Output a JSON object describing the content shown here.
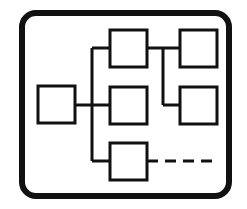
{
  "canvas": {
    "width": 247,
    "height": 209,
    "background_color": "#ffffff",
    "title": "Block Diagram Icon"
  },
  "icon": {
    "name": "network-block-diagram-icon",
    "stroke_color": "#111111",
    "fill_color": "#ffffff",
    "description": "Rounded rectangular frame containing six connected square nodes and a dashed link"
  },
  "frame": {
    "name": "rounded-frame",
    "x": 22,
    "y": 13,
    "width": 207,
    "height": 183,
    "corner_radius": 14,
    "stroke_width": 6,
    "stroke_color": "#111111",
    "fill_color": "#ffffff"
  },
  "nodes": [
    {
      "id": "node-left",
      "label": "left-node",
      "x": 38,
      "y": 86,
      "width": 37,
      "height": 37,
      "stroke_width": 3,
      "stroke_color": "#111111",
      "fill_color": "#ffffff"
    },
    {
      "id": "node-top-middle",
      "label": "top-middle-node",
      "x": 110,
      "y": 30,
      "width": 37,
      "height": 37,
      "stroke_width": 3,
      "stroke_color": "#111111",
      "fill_color": "#ffffff"
    },
    {
      "id": "node-center-middle",
      "label": "center-middle-node",
      "x": 110,
      "y": 87,
      "width": 37,
      "height": 37,
      "stroke_width": 3,
      "stroke_color": "#111111",
      "fill_color": "#ffffff"
    },
    {
      "id": "node-bottom-middle",
      "label": "bottom-middle-node",
      "x": 110,
      "y": 143,
      "width": 37,
      "height": 37,
      "stroke_width": 3,
      "stroke_color": "#111111",
      "fill_color": "#ffffff"
    },
    {
      "id": "node-top-right",
      "label": "top-right-node",
      "x": 180,
      "y": 30,
      "width": 37,
      "height": 37,
      "stroke_width": 3,
      "stroke_color": "#111111",
      "fill_color": "#ffffff"
    },
    {
      "id": "node-bottom-right",
      "label": "bottom-right-node",
      "x": 180,
      "y": 87,
      "width": 37,
      "height": 37,
      "stroke_width": 3,
      "stroke_color": "#111111",
      "fill_color": "#ffffff"
    }
  ],
  "connectors": [
    {
      "id": "connector-trunk-vertical",
      "label": "vertical-trunk-line",
      "points": "92,48 92,161",
      "stroke_width": 3,
      "style": "solid"
    },
    {
      "id": "connector-left-to-trunk",
      "label": "left-node-to-trunk",
      "points": "75,105 110,105",
      "stroke_width": 3,
      "style": "solid"
    },
    {
      "id": "connector-trunk-to-top-middle",
      "label": "trunk-to-top-middle-node",
      "points": "92,48 110,48",
      "stroke_width": 3,
      "style": "solid"
    },
    {
      "id": "connector-trunk-to-bottom-middle",
      "label": "trunk-to-bottom-middle-node",
      "points": "92,161 110,161",
      "stroke_width": 3,
      "style": "solid"
    },
    {
      "id": "connector-top-middle-to-riser",
      "label": "top-middle-node-to-right-riser",
      "points": "147,48 163,48",
      "stroke_width": 3,
      "style": "solid"
    },
    {
      "id": "connector-right-riser-vertical",
      "label": "right-vertical-riser-line",
      "points": "163,48 163,105",
      "stroke_width": 3,
      "style": "solid"
    },
    {
      "id": "connector-riser-to-top-right",
      "label": "riser-to-top-right-node",
      "points": "163,48 180,48",
      "stroke_width": 3,
      "style": "solid"
    },
    {
      "id": "connector-riser-to-bottom-right",
      "label": "riser-to-bottom-right-node",
      "points": "163,105 180,105",
      "stroke_width": 3,
      "style": "solid"
    },
    {
      "id": "connector-dashed-link",
      "label": "dashed-link-from-bottom-middle-node",
      "points": "147,161 214,161",
      "stroke_width": 3,
      "style": "dashed",
      "dash_pattern": "11 7"
    }
  ]
}
